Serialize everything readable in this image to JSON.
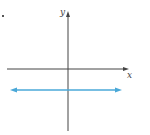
{
  "diagram": {
    "type": "coordinate-plane",
    "x_axis_label": "x",
    "y_axis_label": "y",
    "horizontal_line": {
      "description": "horizontal line below x-axis (y = negative constant)",
      "color": "#4aa8d8",
      "arrows": "both ends"
    },
    "axis_color": "#333333"
  }
}
